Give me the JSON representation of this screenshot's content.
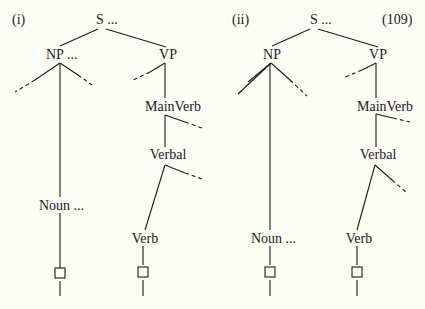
{
  "diagram": {
    "equation_number": "(109)",
    "trees": [
      {
        "id": "i",
        "label": "(i)",
        "nodes": {
          "s": "S ...",
          "np": "NP ...",
          "vp": "VP",
          "mainverb": "MainVerb",
          "verbal": "Verbal",
          "noun": "Noun ...",
          "verb": "Verb"
        }
      },
      {
        "id": "ii",
        "label": "(ii)",
        "nodes": {
          "s": "S ...",
          "np": "NP",
          "vp": "VP",
          "mainverb": "MainVerb",
          "verbal": "Verbal",
          "noun": "Noun ...",
          "verb": "Verb"
        }
      }
    ],
    "colors": {
      "line": "#1a1a1a",
      "background": "#fdfdf7"
    }
  }
}
